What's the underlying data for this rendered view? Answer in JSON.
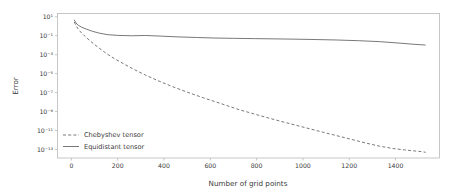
{
  "figure": {
    "background": "#ffffff",
    "frame_color": "#b9b9b9",
    "text_color": "#3b3b3b"
  },
  "chart_data": {
    "type": "line",
    "title": "",
    "xlabel": "Number of grid points",
    "ylabel": "Error",
    "xlim": [
      -60,
      1590
    ],
    "ylim_log10": [
      -13.9,
      1.35
    ],
    "yscale": "log",
    "xscale": "linear",
    "grid": false,
    "legend_position": "lower left",
    "xticks": [
      0,
      200,
      400,
      600,
      800,
      1000,
      1200,
      1400
    ],
    "xtick_labels": [
      "0",
      "200",
      "400",
      "600",
      "800",
      "1000",
      "1200",
      "1400"
    ],
    "yticks_exponent": [
      1,
      -1,
      -3,
      -5,
      -7,
      -9,
      -11,
      -13
    ],
    "ytick_labels": [
      "10¹",
      "10⁻¹",
      "10⁻³",
      "10⁻⁵",
      "10⁻⁷",
      "10⁻⁹",
      "10⁻¹¹",
      "10⁻¹³"
    ],
    "series": [
      {
        "name": "Chebyshev tensor",
        "style": "dashed",
        "color": "#555555",
        "x": [
          12,
          20,
          28,
          40,
          56,
          72,
          96,
          120,
          150,
          185,
          225,
          270,
          320,
          375,
          435,
          500,
          570,
          645,
          725,
          810,
          900,
          995,
          1090,
          1180,
          1260,
          1330,
          1390,
          1440,
          1480,
          1510,
          1530
        ],
        "y_log10": [
          0.45,
          0.1,
          -0.25,
          -0.6,
          -1.0,
          -1.35,
          -1.85,
          -2.3,
          -2.85,
          -3.4,
          -3.95,
          -4.55,
          -5.15,
          -5.75,
          -6.35,
          -6.95,
          -7.55,
          -8.15,
          -8.8,
          -9.4,
          -10.0,
          -10.6,
          -11.2,
          -11.75,
          -12.25,
          -12.65,
          -12.9,
          -13.05,
          -13.15,
          -13.22,
          -13.3
        ]
      },
      {
        "name": "Equidistant tensor",
        "style": "solid",
        "color": "#555555",
        "x": [
          12,
          20,
          30,
          45,
          65,
          90,
          120,
          155,
          200,
          260,
          320,
          390,
          460,
          540,
          620,
          700,
          790,
          880,
          970,
          1060,
          1150,
          1240,
          1330,
          1410,
          1480,
          1530
        ],
        "y_log10": [
          0.7,
          0.35,
          0.1,
          -0.1,
          -0.3,
          -0.52,
          -0.72,
          -0.88,
          -0.96,
          -1.0,
          -0.97,
          -1.04,
          -1.12,
          -1.18,
          -1.24,
          -1.27,
          -1.3,
          -1.33,
          -1.36,
          -1.4,
          -1.45,
          -1.52,
          -1.62,
          -1.76,
          -1.9,
          -1.98
        ]
      }
    ]
  },
  "legend": {
    "items": [
      {
        "label": "Chebyshev tensor",
        "style": "dashed"
      },
      {
        "label": "Equidistant tensor",
        "style": "solid"
      }
    ]
  }
}
